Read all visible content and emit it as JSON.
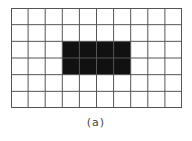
{
  "diagram": {
    "grid": {
      "columns": 10,
      "rows": 6,
      "line_color": "#555555",
      "background": "#ffffff"
    },
    "filled_region": {
      "col_start": 3,
      "col_end": 7,
      "row_start": 2,
      "row_end": 4,
      "color": "#111111"
    },
    "caption": "(a)"
  }
}
